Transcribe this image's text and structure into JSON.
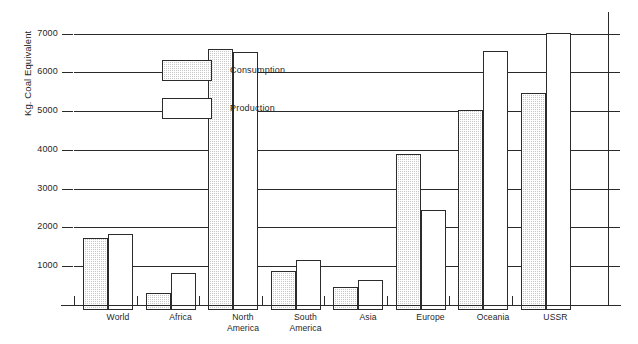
{
  "chart_data": {
    "type": "bar",
    "title": "",
    "subtitle": "",
    "xlabel": "",
    "ylabel": "Kg. Coal Equivalent",
    "ylim": [
      0,
      7400
    ],
    "yticks": [
      1000,
      2000,
      3000,
      4000,
      5000,
      6000,
      7000
    ],
    "ytick_labels": [
      "1000",
      "2000",
      "3000",
      "4000",
      "5000",
      "6000",
      "7000"
    ],
    "grid": true,
    "legend_position": "upper-left-inside",
    "categories": [
      "World",
      "Africa",
      "North America",
      "South America",
      "Asia",
      "Europe",
      "Oceania",
      "USSR"
    ],
    "category_lines": [
      [
        "World"
      ],
      [
        "Africa"
      ],
      [
        "North",
        "America"
      ],
      [
        "South",
        "America"
      ],
      [
        "Asia"
      ],
      [
        "Europe"
      ],
      [
        "Oceania"
      ],
      [
        "USSR"
      ]
    ],
    "series": [
      {
        "name": "Consumption",
        "fill": "hatched-gray",
        "values": [
          1860,
          440,
          6720,
          1000,
          600,
          4030,
          5170,
          5590
        ]
      },
      {
        "name": "Production",
        "fill": "white",
        "values": [
          1970,
          950,
          6640,
          1290,
          780,
          2590,
          6670,
          7150
        ]
      }
    ]
  },
  "legend": {
    "items": [
      {
        "label": "Consumption",
        "fill": "hatched-gray"
      },
      {
        "label": "Production",
        "fill": "white"
      }
    ]
  },
  "colors": {
    "axis": "#2a2a2a",
    "consumption_fill": "#c9c9c9",
    "production_fill": "#ffffff",
    "background": "#ffffff",
    "text": "#1f1f1f"
  }
}
